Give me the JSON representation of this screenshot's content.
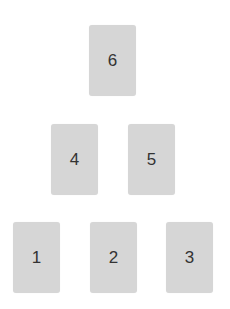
{
  "cards": [
    {
      "label": "1",
      "x": 13,
      "y": 222
    },
    {
      "label": "2",
      "x": 90,
      "y": 222
    },
    {
      "label": "3",
      "x": 166,
      "y": 222
    },
    {
      "label": "4",
      "x": 51,
      "y": 124
    },
    {
      "label": "5",
      "x": 128,
      "y": 124
    },
    {
      "label": "6",
      "x": 89,
      "y": 25
    }
  ],
  "colors": {
    "card_bg": "#d6d6d6",
    "text": "#333333",
    "background": "#ffffff"
  }
}
